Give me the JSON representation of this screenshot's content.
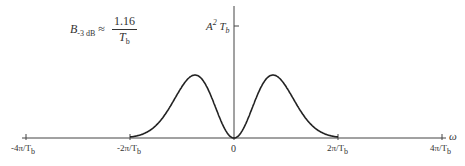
{
  "chart_data": {
    "type": "line",
    "title": "",
    "xlabel": "ω",
    "ylabel": "",
    "y_axis_marker": "A² T_b",
    "annotation": "B_{-3 dB} ≈ 1.16 / T_b",
    "x_ticks": [
      "-4π/T_b",
      "-2π/T_b",
      "0",
      "2π/T_b",
      "4π/T_b"
    ],
    "x_tick_values": [
      -4,
      -2,
      0,
      2,
      4
    ],
    "x_unit": "π/T_b",
    "xlim": [
      -4,
      4
    ],
    "ylim": [
      0,
      1
    ],
    "grid": false,
    "series": [
      {
        "name": "spectrum",
        "x": [
          -4,
          -3.5,
          -3,
          -2.5,
          -2,
          -1.75,
          -1.5,
          -1.25,
          -1,
          -0.5,
          0,
          0.5,
          1,
          1.25,
          1.5,
          1.75,
          2,
          2.5,
          3,
          3.5,
          4
        ],
        "values": [
          0.0,
          0.01,
          0.05,
          0.22,
          0.6,
          0.8,
          0.9,
          0.82,
          0.62,
          0.25,
          0.0,
          0.25,
          0.62,
          0.82,
          0.9,
          0.8,
          0.6,
          0.22,
          0.05,
          0.01,
          0.0
        ]
      }
    ]
  },
  "labels": {
    "formula_B": "B",
    "formula_sub": "-3 dB",
    "formula_approx": "≈",
    "formula_num": "1.16",
    "formula_den_T": "T",
    "formula_den_sub": "b",
    "ymark_A": "A",
    "ymark_sup": "2",
    "ymark_T": "T",
    "ymark_sub": "b",
    "omega": "ω",
    "tick_m4": "-4π/T",
    "tick_m2": "-2π/T",
    "tick_0": "0",
    "tick_p2": "2π/T",
    "tick_p4": "4π/T",
    "tick_sub": "b"
  }
}
